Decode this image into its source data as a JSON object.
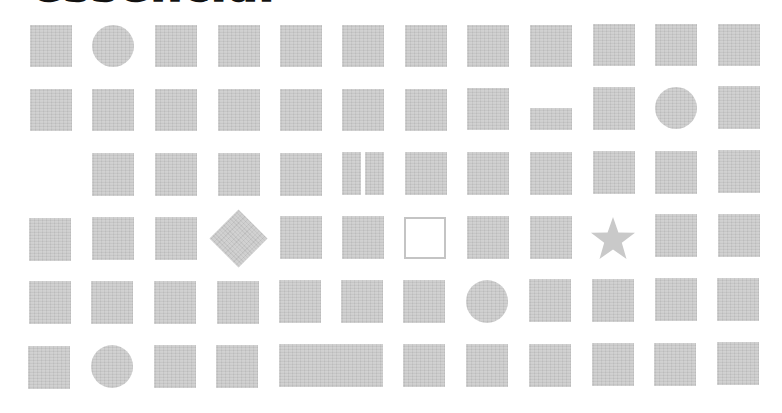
{
  "header": {
    "title": "essencial"
  },
  "colors": {
    "shape_fill": "#c9c9c9",
    "outline_stroke": "#c4c4c4",
    "title_text": "#111111",
    "background": "#ffffff"
  },
  "grid": {
    "columns": 12,
    "rows": 6,
    "cells": [
      [
        "square",
        "circle",
        "square",
        "square",
        "square",
        "square",
        "square",
        "square",
        "square",
        "square",
        "square",
        "square"
      ],
      [
        "square",
        "square",
        "square",
        "square",
        "square",
        "square",
        "square",
        "square",
        "dash",
        "square",
        "circle",
        "square"
      ],
      [
        "empty",
        "square",
        "square",
        "square",
        "square",
        "split-bars",
        "square",
        "square",
        "square",
        "square",
        "square",
        "square"
      ],
      [
        "square",
        "square",
        "square",
        "diamond",
        "square",
        "square",
        "outline-square",
        "square",
        "square",
        "star",
        "square",
        "square"
      ],
      [
        "square",
        "square",
        "square",
        "square",
        "square",
        "square",
        "square",
        "circle",
        "square",
        "square",
        "square",
        "square"
      ],
      [
        "square",
        "circle",
        "square",
        "square",
        "wide-rect",
        "covered",
        "square",
        "square",
        "square",
        "square",
        "square",
        "square"
      ]
    ]
  }
}
